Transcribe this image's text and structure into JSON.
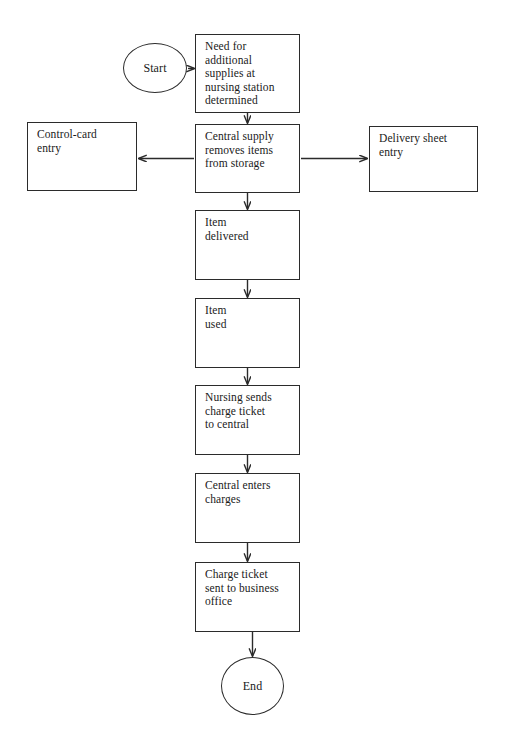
{
  "document": {
    "kind": "flowchart",
    "title": "Central supply charge flow",
    "canvas": {
      "width": 508,
      "height": 744,
      "background": "#ffffff"
    },
    "stroke_color": "#2b2b2b",
    "text_color": "#1a1a1a"
  },
  "chart_data": {
    "type": "diagram",
    "title": "",
    "nodes": [
      {
        "id": "start",
        "shape": "circle",
        "label": "Start",
        "x": 123,
        "y": 43,
        "w": 64,
        "h": 50
      },
      {
        "id": "need",
        "shape": "rect",
        "label": "Need for\nadditional\nsupplies at\nnursing station\ndetermined",
        "x": 195,
        "y": 34,
        "w": 105,
        "h": 79
      },
      {
        "id": "control_card",
        "shape": "rect",
        "label": "Control-card\nentry",
        "x": 27,
        "y": 122,
        "w": 110,
        "h": 69
      },
      {
        "id": "central_supply",
        "shape": "rect",
        "label": "Central supply\nremoves items\nfrom storage",
        "x": 195,
        "y": 124,
        "w": 105,
        "h": 69
      },
      {
        "id": "delivery_sheet",
        "shape": "rect",
        "label": "Delivery sheet\nentry",
        "x": 369,
        "y": 126,
        "w": 109,
        "h": 66
      },
      {
        "id": "item_delivered",
        "shape": "rect",
        "label": "Item\ndelivered",
        "x": 195,
        "y": 210,
        "w": 105,
        "h": 70
      },
      {
        "id": "item_used",
        "shape": "rect",
        "label": "Item\nused",
        "x": 195,
        "y": 298,
        "w": 105,
        "h": 70
      },
      {
        "id": "nursing_sends",
        "shape": "rect",
        "label": "Nursing sends\ncharge ticket\nto central",
        "x": 195,
        "y": 385,
        "w": 105,
        "h": 70
      },
      {
        "id": "central_enters",
        "shape": "rect",
        "label": "Central enters\ncharges",
        "x": 195,
        "y": 473,
        "w": 105,
        "h": 70
      },
      {
        "id": "charge_ticket",
        "shape": "rect",
        "label": "Charge ticket\nsent to business\noffice",
        "x": 195,
        "y": 562,
        "w": 105,
        "h": 70
      },
      {
        "id": "end",
        "shape": "circle",
        "label": "End",
        "x": 221,
        "y": 657,
        "w": 63,
        "h": 58
      }
    ],
    "edges": [
      {
        "id": "start-to-need",
        "from": "start",
        "to": "need",
        "direction": "right",
        "label": ""
      },
      {
        "id": "need-to-central-supply",
        "from": "need",
        "to": "central_supply",
        "direction": "down",
        "label": ""
      },
      {
        "id": "central-supply-to-control",
        "from": "central_supply",
        "to": "control_card",
        "direction": "left",
        "label": ""
      },
      {
        "id": "central-supply-to-delivery",
        "from": "central_supply",
        "to": "delivery_sheet",
        "direction": "right",
        "label": ""
      },
      {
        "id": "central-supply-to-item",
        "from": "central_supply",
        "to": "item_delivered",
        "direction": "down",
        "label": ""
      },
      {
        "id": "item-delivered-to-used",
        "from": "item_delivered",
        "to": "item_used",
        "direction": "down",
        "label": ""
      },
      {
        "id": "item-used-to-nursing",
        "from": "item_used",
        "to": "nursing_sends",
        "direction": "down",
        "label": ""
      },
      {
        "id": "nursing-to-central-enters",
        "from": "nursing_sends",
        "to": "central_enters",
        "direction": "down",
        "label": ""
      },
      {
        "id": "central-enters-to-charge",
        "from": "central_enters",
        "to": "charge_ticket",
        "direction": "down",
        "label": ""
      },
      {
        "id": "charge-ticket-to-end",
        "from": "charge_ticket",
        "to": "end",
        "direction": "down",
        "label": ""
      }
    ]
  }
}
